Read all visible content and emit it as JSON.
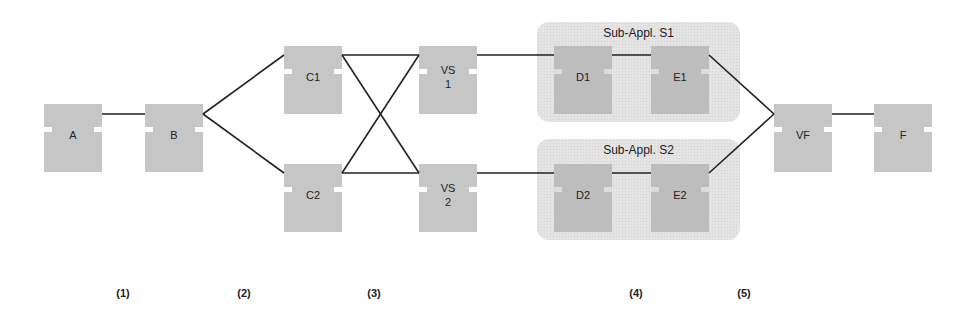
{
  "diagram": {
    "groups": [
      {
        "id": "S1",
        "title": "Sub-Appl. S1",
        "x": 537,
        "y": 22,
        "w": 203,
        "h": 100
      },
      {
        "id": "S2",
        "title": "Sub-Appl. S2",
        "x": 537,
        "y": 139,
        "w": 203,
        "h": 101
      }
    ],
    "nodes": [
      {
        "id": "A",
        "label": "A",
        "x": 44,
        "y": 104
      },
      {
        "id": "B",
        "label": "B",
        "x": 145,
        "y": 104
      },
      {
        "id": "C1",
        "label": "C1",
        "x": 284,
        "y": 46
      },
      {
        "id": "C2",
        "label": "C2",
        "x": 284,
        "y": 164
      },
      {
        "id": "VS1",
        "label": "VS\n1",
        "x": 419,
        "y": 46
      },
      {
        "id": "VS2",
        "label": "VS\n2",
        "x": 419,
        "y": 164
      },
      {
        "id": "D1",
        "label": "D1",
        "x": 554,
        "y": 46,
        "group": "S1"
      },
      {
        "id": "E1",
        "label": "E1",
        "x": 651,
        "y": 46,
        "group": "S1"
      },
      {
        "id": "D2",
        "label": "D2",
        "x": 554,
        "y": 164,
        "group": "S2"
      },
      {
        "id": "E2",
        "label": "E2",
        "x": 651,
        "y": 164,
        "group": "S2"
      },
      {
        "id": "VF",
        "label": "VF",
        "x": 774,
        "y": 104
      },
      {
        "id": "F",
        "label": "F",
        "x": 874,
        "y": 104
      }
    ],
    "edges": [
      {
        "from": "A",
        "to": "B",
        "x1": 102,
        "y1": 114,
        "x2": 145,
        "y2": 114
      },
      {
        "from": "B",
        "to": "C1",
        "x1": 203,
        "y1": 114,
        "x2": 284,
        "y2": 55
      },
      {
        "from": "B",
        "to": "C2",
        "x1": 203,
        "y1": 114,
        "x2": 284,
        "y2": 173
      },
      {
        "from": "C1",
        "to": "VS1",
        "x1": 342,
        "y1": 55,
        "x2": 419,
        "y2": 55
      },
      {
        "from": "C1",
        "to": "VS2",
        "x1": 342,
        "y1": 55,
        "x2": 419,
        "y2": 173
      },
      {
        "from": "C2",
        "to": "VS1",
        "x1": 342,
        "y1": 173,
        "x2": 419,
        "y2": 55
      },
      {
        "from": "C2",
        "to": "VS2",
        "x1": 342,
        "y1": 173,
        "x2": 419,
        "y2": 173
      },
      {
        "from": "VS1",
        "to": "D1",
        "x1": 477,
        "y1": 55,
        "x2": 554,
        "y2": 55
      },
      {
        "from": "VS2",
        "to": "D2",
        "x1": 477,
        "y1": 173,
        "x2": 554,
        "y2": 173
      },
      {
        "from": "D1",
        "to": "E1",
        "x1": 612,
        "y1": 55,
        "x2": 651,
        "y2": 55
      },
      {
        "from": "D2",
        "to": "E2",
        "x1": 612,
        "y1": 173,
        "x2": 651,
        "y2": 173
      },
      {
        "from": "E1",
        "to": "VF",
        "x1": 709,
        "y1": 55,
        "x2": 774,
        "y2": 114
      },
      {
        "from": "E2",
        "to": "VF",
        "x1": 709,
        "y1": 173,
        "x2": 774,
        "y2": 114
      },
      {
        "from": "VF",
        "to": "F",
        "x1": 832,
        "y1": 114,
        "x2": 874,
        "y2": 114
      }
    ],
    "steps": [
      {
        "label": "(1)",
        "x": 123
      },
      {
        "label": "(2)",
        "x": 244
      },
      {
        "label": "(3)",
        "x": 374
      },
      {
        "label": "(4)",
        "x": 636
      },
      {
        "label": "(5)",
        "x": 744
      }
    ],
    "colors": {
      "node_fill": "#c6c6c6",
      "group_fill": "#e4e4e4",
      "edge_stroke": "#222222"
    }
  }
}
